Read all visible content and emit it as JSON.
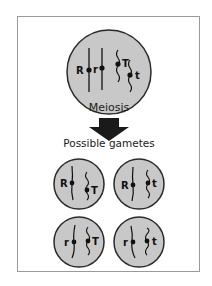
{
  "diagram": {
    "parent_cell": {
      "alleles": [
        "R",
        "r",
        "T",
        "t"
      ],
      "chromosome_pairs": [
        {
          "type": "straight",
          "alleles": [
            "R",
            "r"
          ]
        },
        {
          "type": "wavy",
          "alleles": [
            "T",
            "t"
          ]
        }
      ]
    },
    "process_label": "Meiosis",
    "arrow": "down-arrow",
    "gametes_label": "Possible gametes",
    "gametes": [
      {
        "alleles": [
          "R",
          "T"
        ]
      },
      {
        "alleles": [
          "R",
          "t"
        ]
      },
      {
        "alleles": [
          "r",
          "T"
        ]
      },
      {
        "alleles": [
          "r",
          "t"
        ]
      }
    ],
    "colors": {
      "cell_fill": "#c8c8c8",
      "cell_stroke": "#2a2a2a",
      "arrow": "#1a1a1a",
      "frame": "#9a9a9a"
    }
  }
}
